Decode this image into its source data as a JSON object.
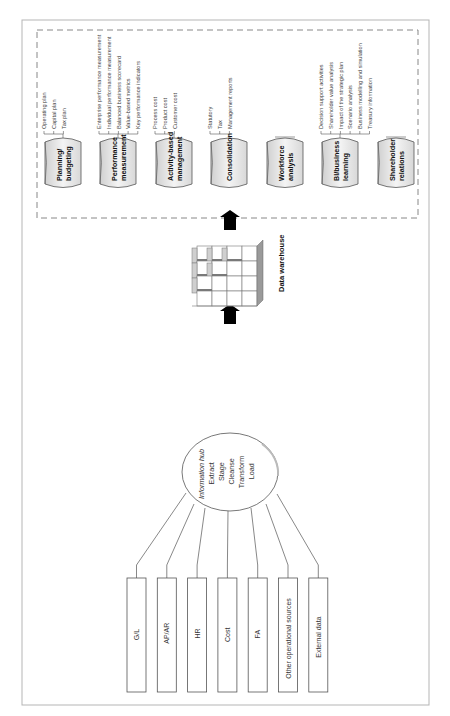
{
  "diagram": {
    "orientation": "rotated 90deg counter-clockwise",
    "sources": [
      {
        "label": "G/L"
      },
      {
        "label": "AP/AR"
      },
      {
        "label": "HR"
      },
      {
        "label": "Cost"
      },
      {
        "label": "FA"
      },
      {
        "label": "Other operational sources"
      },
      {
        "label": "External data"
      }
    ],
    "hub": {
      "title": "Information hub",
      "steps": [
        "Extract",
        "Stage",
        "Cleanse",
        "Transform",
        "Load"
      ]
    },
    "warehouse": {
      "label": "Data warehouse"
    },
    "applications": [
      {
        "name_lines": [
          "Planning/",
          "budgeting"
        ],
        "details": [
          "Operating plan",
          "Capital plan",
          "Tax plan"
        ]
      },
      {
        "name_lines": [
          "Performance",
          "measurement"
        ],
        "details": [
          "Enterprise performance measurement",
          "Individual performance measurement",
          "Balanced business scorecard",
          "Value-based metrics",
          "Key performance indicators"
        ]
      },
      {
        "name_lines": [
          "Activity-based",
          "management"
        ],
        "details": [
          "Process cost",
          "Product cost",
          "Customer cost"
        ]
      },
      {
        "name_lines": [
          "Consolidation"
        ],
        "details": [
          "Statutory",
          "Tax",
          "Management reports"
        ]
      },
      {
        "name_lines": [
          "Workforce",
          "analysis"
        ],
        "details": []
      },
      {
        "name_lines": [
          "BI/business",
          "learning"
        ],
        "details": [
          "Decision support activities",
          "Shareholder value analysis",
          "Impact of the strategic plan",
          "Scenario analysis",
          "Business modelling and simulation",
          "Treasury information"
        ]
      },
      {
        "name_lines": [
          "Shareholder",
          "relations"
        ],
        "details": []
      }
    ],
    "colors": {
      "line": "#555555",
      "cylinder_fill": "#e6e6e6",
      "cylinder_top": "#c8c8c8",
      "arrow": "#000000",
      "dashed": "#888888"
    }
  }
}
